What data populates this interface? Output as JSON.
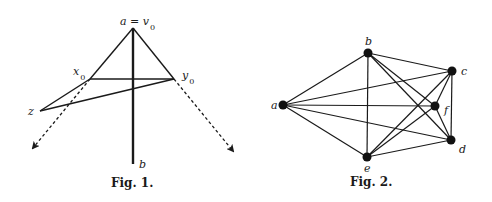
{
  "figures": [
    {
      "id": "fig1",
      "caption": "Fig. 1.",
      "points": {
        "a": {
          "label": "a = v",
          "sub": "0",
          "x": 133,
          "y": 28
        },
        "x0": {
          "label": "x",
          "sub": "0",
          "x": 90,
          "y": 79
        },
        "y0": {
          "label": "y",
          "sub": "0",
          "x": 174,
          "y": 79
        },
        "z": {
          "label": "z",
          "x": 40,
          "y": 111
        },
        "b": {
          "label": "b",
          "x": 133,
          "y": 164
        }
      },
      "solid_edges": [
        [
          "a",
          "x0"
        ],
        [
          "a",
          "y0"
        ],
        [
          "x0",
          "y0"
        ],
        [
          "x0",
          "z"
        ],
        [
          "z",
          "y0"
        ],
        [
          "a",
          "b"
        ]
      ],
      "dashed_arrows": [
        {
          "from": [
            90,
            79
          ],
          "to": [
            33,
            148
          ]
        },
        {
          "from": [
            174,
            79
          ],
          "to": [
            233,
            151
          ]
        }
      ]
    },
    {
      "id": "fig2",
      "caption": "Fig. 2.",
      "nodes": [
        {
          "id": "a",
          "label": "a",
          "x": 283,
          "y": 105
        },
        {
          "id": "b",
          "label": "b",
          "x": 368,
          "y": 53
        },
        {
          "id": "c",
          "label": "c",
          "x": 452,
          "y": 71
        },
        {
          "id": "f",
          "label": "f",
          "x": 435,
          "y": 106
        },
        {
          "id": "d",
          "label": "d",
          "x": 451,
          "y": 140
        },
        {
          "id": "e",
          "label": "e",
          "x": 367,
          "y": 157
        }
      ],
      "edges": [
        [
          "a",
          "b"
        ],
        [
          "a",
          "c"
        ],
        [
          "a",
          "f"
        ],
        [
          "a",
          "d"
        ],
        [
          "a",
          "e"
        ],
        [
          "b",
          "c"
        ],
        [
          "b",
          "f"
        ],
        [
          "b",
          "d"
        ],
        [
          "b",
          "e"
        ],
        [
          "c",
          "f"
        ],
        [
          "c",
          "d"
        ],
        [
          "c",
          "e"
        ],
        [
          "f",
          "d"
        ],
        [
          "f",
          "e"
        ],
        [
          "d",
          "e"
        ]
      ]
    }
  ]
}
